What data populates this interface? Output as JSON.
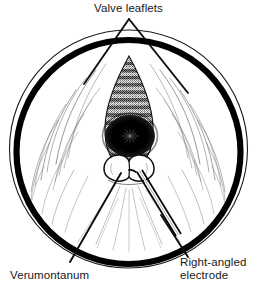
{
  "figure": {
    "type": "medical-line-illustration",
    "background_color": "#ffffff",
    "ink_color": "#000000",
    "text_color": "#191919",
    "canvas": {
      "width": 257,
      "height": 289
    }
  },
  "labels": {
    "valve_leaflets": "Valve leaflets",
    "verumontanum": "Verumontanum",
    "right_angled_electrode_line1": "Right-angled",
    "right_angled_electrode_line2": "electrode"
  },
  "annotations": {
    "valve_leaflets_leader": "inverted-v-leader-line",
    "verumontanum_leader": "straight-leader-line",
    "electrode_leader": "straight-leader-line"
  },
  "anatomy": {
    "outer_thin_circle": "urethral-field-outline",
    "inner_thick_ring": "cystoscope-sheath-ring",
    "cone_cavity": "prostatic-urethra-lumen",
    "ridged_bands": "mucosal-ridges",
    "dark_lumen": "bladder-neck-opening",
    "bilobed_mound": "verumontanum-structure",
    "instrument": "right-angled-electrode-shaft"
  }
}
